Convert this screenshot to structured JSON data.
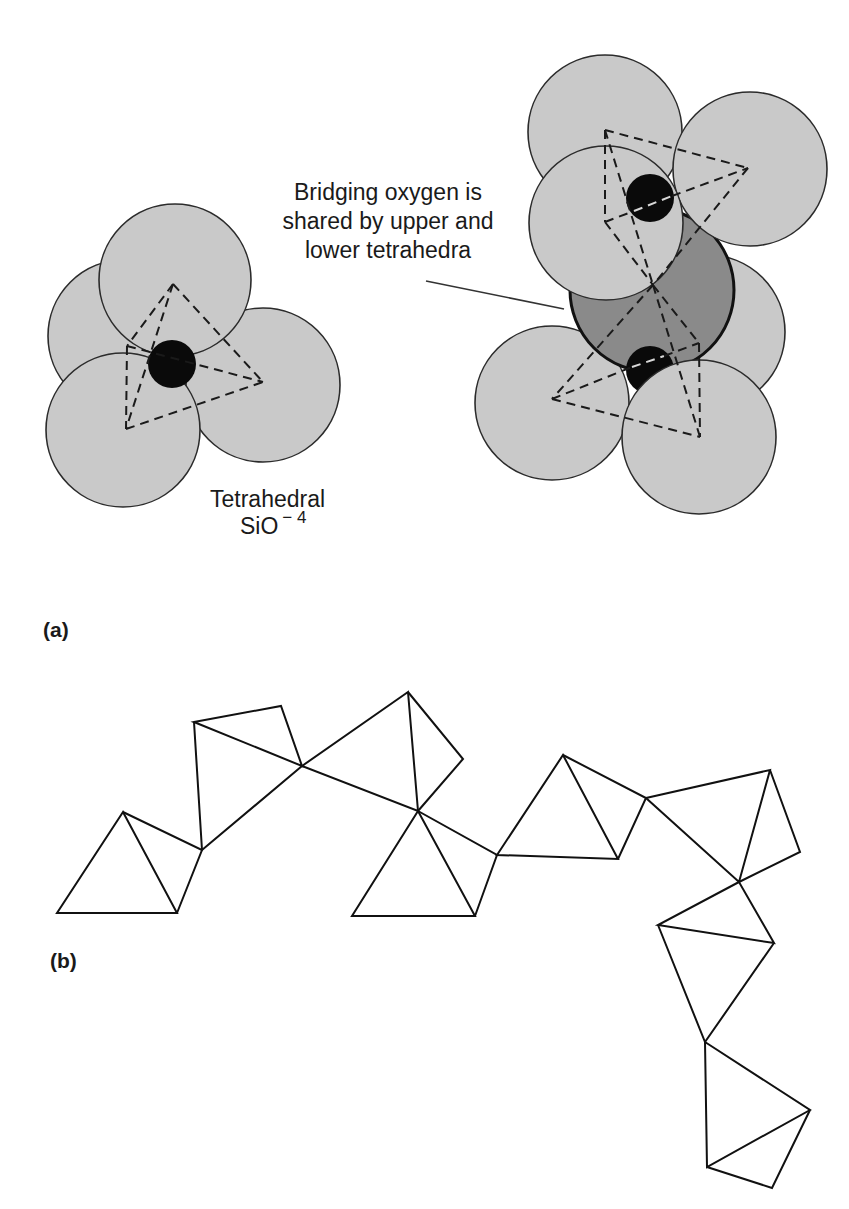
{
  "panel_a": {
    "label": "(a)",
    "single_tetrahedron": {
      "label_line1": "Tetrahedral",
      "label_formula": "SiO",
      "label_charge": "− 4"
    },
    "bridging_annotation": {
      "line1": "Bridging oxygen is",
      "line2": "shared by upper and",
      "line3": "lower tetrahedra"
    }
  },
  "panel_b": {
    "label": "(b)",
    "description": "Chain of corner-sharing SiO4 tetrahedra"
  },
  "colors": {
    "oxygen_fill": "#c9c9c9",
    "bridging_oxygen_fill": "#8a8a8a",
    "silicon_fill": "#0a0a0a",
    "line": "#1a1a1a"
  }
}
